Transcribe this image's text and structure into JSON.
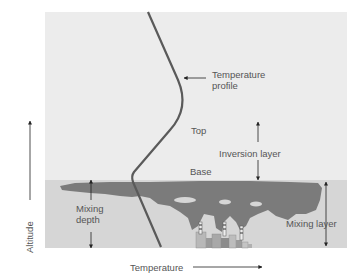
{
  "diagram": {
    "labels": {
      "temperature_profile_line1": "Temperature",
      "temperature_profile_line2": "profile",
      "top": "Top",
      "inversion_layer": "Inversion layer",
      "base": "Base",
      "mixing_depth_line1": "Mixing",
      "mixing_depth_line2": "depth",
      "mixing_layer": "Mixing layer",
      "x_axis": "Temperature",
      "y_axis": "Altitude"
    },
    "colors": {
      "upper_air": "#ececec",
      "mixing_layer": "#d6d6d6",
      "smog": "#7b7b7b",
      "profile_line": "#5a5a5a",
      "arrows": "#222222"
    }
  }
}
